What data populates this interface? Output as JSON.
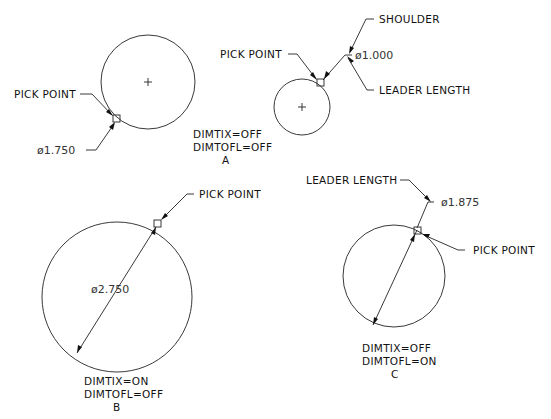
{
  "diagram": {
    "panels": [
      {
        "id": "A",
        "label": "A",
        "settings": [
          "DIMTIX=OFF",
          "DIMTOFL=OFF"
        ],
        "left_example": {
          "pick_label": "PICK POINT",
          "dimension": "ø1.750"
        },
        "right_example": {
          "pick_label": "PICK POINT",
          "dimension": "ø1.000",
          "shoulder_label": "SHOULDER",
          "leader_label": "LEADER LENGTH"
        }
      },
      {
        "id": "B",
        "label": "B",
        "settings": [
          "DIMTIX=ON",
          "DIMTOFL=OFF"
        ],
        "pick_label": "PICK POINT",
        "dimension": "ø2.750"
      },
      {
        "id": "C",
        "label": "C",
        "settings": [
          "DIMTIX=OFF",
          "DIMTOFL=ON"
        ],
        "pick_label": "PICK POINT",
        "leader_label": "LEADER LENGTH",
        "dimension": "ø1.875"
      }
    ]
  }
}
